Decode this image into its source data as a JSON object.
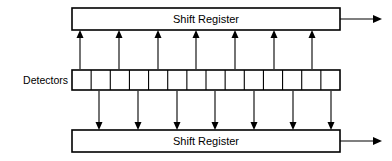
{
  "diagram": {
    "background_color": "#ffffff",
    "line_color": "#000000",
    "blocks": {
      "top_register": {
        "label": "Shift Register",
        "x": 72,
        "y": 8,
        "width": 268,
        "height": 22
      },
      "bottom_register": {
        "label": "Shift Register",
        "x": 72,
        "y": 130,
        "width": 268,
        "height": 22
      },
      "detectors": {
        "label": "Detectors",
        "x": 72,
        "y": 70,
        "width": 268,
        "height": 20,
        "cell_count": 14,
        "label_x": 68,
        "label_y": 80
      }
    },
    "connections": {
      "up_arrow_count": 7,
      "up_arrow_x": [
        80,
        119,
        158,
        196,
        235,
        274,
        312
      ],
      "up_arrow_y_top": 31,
      "up_arrow_y_bottom": 69,
      "down_arrow_count": 7,
      "down_arrow_x": [
        99,
        138,
        177,
        215,
        254,
        293,
        331
      ],
      "down_arrow_y_top": 91,
      "down_arrow_y_bottom": 129,
      "top_output_arrow": {
        "x_start": 340,
        "x_end": 382,
        "y": 19
      },
      "bottom_output_arrow": {
        "x_start": 340,
        "x_end": 382,
        "y": 141
      }
    }
  }
}
